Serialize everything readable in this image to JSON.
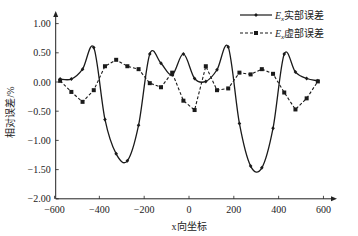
{
  "chart_data": {
    "type": "line",
    "title": "",
    "xlabel": "x向坐标",
    "ylabel": "相对误差/%",
    "xlim": [
      -600,
      700
    ],
    "ylim": [
      -2.0,
      1.2
    ],
    "x_ticks": [
      -600,
      -400,
      -200,
      0,
      200,
      400,
      600
    ],
    "x_tick_labels": [
      "−600",
      "−400",
      "−200",
      "0",
      "200",
      "400",
      "600"
    ],
    "y_ticks": [
      1.0,
      0.5,
      0.0,
      -0.5,
      -1.0,
      -1.5,
      -2.0
    ],
    "y_tick_labels": [
      "1.00",
      "0.50",
      "0.00",
      "−0.50",
      "−1.00",
      "−1.50",
      "−2.00"
    ],
    "grid": false,
    "legend_position": "upper right",
    "x": [
      -575,
      -525,
      -475,
      -425,
      -375,
      -325,
      -275,
      -225,
      -175,
      -125,
      -75,
      -25,
      25,
      75,
      125,
      175,
      225,
      275,
      325,
      375,
      425,
      475,
      525,
      575
    ],
    "series": [
      {
        "name": "Ex实部误差",
        "legend_main": "E",
        "legend_sub": "x",
        "legend_suffix": "实部误差",
        "style": "solid",
        "marker": "diamond",
        "color": "#1a1a1a",
        "values": [
          0.05,
          0.05,
          0.22,
          0.59,
          -0.64,
          -1.23,
          -1.35,
          -0.74,
          0.48,
          0.32,
          0.12,
          0.48,
          0.06,
          0.01,
          0.21,
          0.6,
          -0.71,
          -1.44,
          -1.47,
          -0.79,
          0.48,
          0.17,
          0.06,
          0.02
        ]
      },
      {
        "name": "Ex虚部误差",
        "legend_main": "E",
        "legend_sub": "x",
        "legend_suffix": "虚部误差",
        "style": "dashed",
        "marker": "square",
        "color": "#1a1a1a",
        "values": [
          0.02,
          -0.17,
          -0.34,
          -0.14,
          0.27,
          0.38,
          0.27,
          0.22,
          -0.02,
          -0.09,
          0.16,
          -0.32,
          -0.48,
          0.27,
          -0.14,
          -0.11,
          0.16,
          0.13,
          0.22,
          0.14,
          -0.18,
          -0.47,
          -0.28,
          0.01
        ]
      }
    ]
  }
}
